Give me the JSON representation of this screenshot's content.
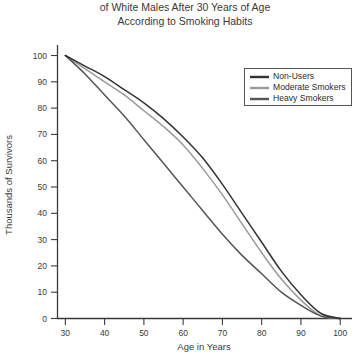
{
  "chart_data": {
    "type": "line",
    "title": "of White Males After 30 Years of Age\nAccording to Smoking Habits",
    "title_lines": [
      "of White Males After 30 Years of Age",
      "According to Smoking Habits"
    ],
    "xlabel": "Age in Years",
    "ylabel": "Thousands of Survivors",
    "xlim": [
      28,
      103
    ],
    "ylim": [
      0,
      104
    ],
    "xticks": [
      30,
      40,
      50,
      60,
      70,
      80,
      90,
      100
    ],
    "yticks": [
      0,
      10,
      20,
      30,
      40,
      50,
      60,
      70,
      80,
      90,
      100
    ],
    "grid": false,
    "legend_position": "upper-right",
    "x": [
      30,
      35,
      40,
      45,
      50,
      55,
      60,
      65,
      70,
      75,
      80,
      85,
      90,
      95,
      100
    ],
    "series": [
      {
        "name": "Non-Users",
        "color": "#333333",
        "values": [
          100,
          96,
          92,
          87,
          82,
          76,
          69,
          61,
          51,
          40,
          29,
          18,
          9,
          2,
          0
        ]
      },
      {
        "name": "Moderate Smokers",
        "color": "#9a9a9a",
        "values": [
          100,
          95,
          90,
          85,
          79,
          73,
          66,
          57,
          47,
          36,
          25,
          15,
          7,
          1,
          0
        ]
      },
      {
        "name": "Heavy Smokers",
        "color": "#555555",
        "values": [
          100,
          93,
          85,
          77,
          68,
          59,
          50,
          41,
          32,
          24,
          17,
          10,
          5,
          1,
          0
        ]
      }
    ]
  },
  "legend": {
    "items": [
      {
        "label": "Non-Users",
        "color": "#333333"
      },
      {
        "label": "Moderate Smokers",
        "color": "#9a9a9a"
      },
      {
        "label": "Heavy Smokers",
        "color": "#555555"
      }
    ]
  }
}
